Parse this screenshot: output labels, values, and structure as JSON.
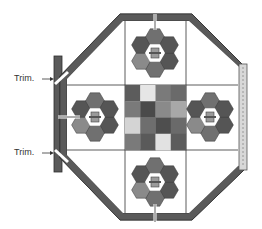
{
  "diagram": {
    "type": "octagonal-board-layout",
    "labels": {
      "trim_top": "Trim.",
      "trim_bottom": "Trim."
    },
    "colors": {
      "frame": "#5a5a5a",
      "frame_edge": "#2e2e2e",
      "grid_line": "#333333",
      "hex_dark": "#555555",
      "hex_mid": "#707070",
      "hex_light": "#8a8a8a",
      "strip": "#d8d8d8",
      "background": "#ffffff"
    },
    "checkerboard": {
      "rows": 4,
      "cols": 4,
      "shades": [
        [
          "#5c5c5c",
          "#e6e6e6",
          "#7a7a7a",
          "#6a6a6a"
        ],
        [
          "#7a7a7a",
          "#4a4a4a",
          "#8a8a8a",
          "#a8a8a8"
        ],
        [
          "#d4d4d4",
          "#6e6e6e",
          "#4e4e4e",
          "#6a6a6a"
        ],
        [
          "#7a7a7a",
          "#5a5a5a",
          "#e2e2e2",
          "#5c5c5c"
        ]
      ]
    },
    "medallions": [
      {
        "position": "top",
        "emblem": "face-icon"
      },
      {
        "position": "left",
        "emblem": "ship-icon"
      },
      {
        "position": "right",
        "emblem": "robot-icon"
      },
      {
        "position": "bottom",
        "emblem": "rocket-icon"
      }
    ]
  }
}
